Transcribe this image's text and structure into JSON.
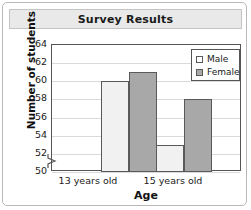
{
  "chart_data": {
    "type": "bar",
    "title": "Survey Results",
    "xlabel": "Age",
    "ylabel": "Number of students",
    "categories": [
      "13 years old",
      "15 years old"
    ],
    "series": [
      {
        "name": "Male",
        "values": [
          60,
          53
        ],
        "color": "#f1f1f1"
      },
      {
        "name": "Female",
        "values": [
          61,
          58
        ],
        "color": "#a8a8a8"
      }
    ],
    "ylim": [
      50,
      64
    ],
    "yticks": [
      50,
      52,
      54,
      56,
      58,
      60,
      62,
      64
    ],
    "ytick_labels": [
      "50",
      "52",
      "54",
      "56",
      "58",
      "60",
      "62",
      "64"
    ],
    "axis_break": true,
    "grid": true,
    "legend_position": "top-right",
    "legend_entries": [
      "Male",
      "Female"
    ]
  },
  "header": {
    "title": "Survey Results"
  },
  "axes": {
    "y_title": "Number of students",
    "x_title": "Age"
  },
  "colors": {
    "male_bar": "#f1f1f1",
    "female_bar": "#a8a8a8",
    "bar_border": "#5a5a5a",
    "grid": "#dadada",
    "title_bar": "#e9e9e9"
  }
}
